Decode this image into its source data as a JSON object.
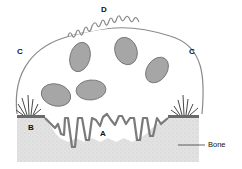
{
  "diagram": {
    "labels": {
      "A": "A",
      "B": "B",
      "C_left": "C",
      "C_right": "C",
      "D": "D",
      "bone": "Bone"
    },
    "colors": {
      "membrane": "#8a8a8a",
      "nucleus_fill": "#a6a6a6",
      "nucleus_stroke": "#6e6e6e",
      "bone_fill": "#dedede",
      "sealing_zone": "#6a6a6a",
      "text": "#111111"
    },
    "nuclei_count": 5
  }
}
